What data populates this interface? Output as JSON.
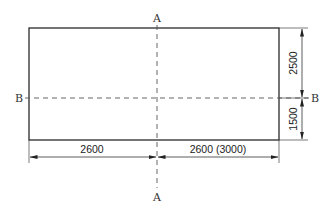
{
  "diagram": {
    "type": "plan-dimension-drawing",
    "section_labels": {
      "vertical_top": "A",
      "vertical_bottom": "A",
      "horizontal_left": "B",
      "horizontal_right": "B"
    },
    "dimensions": {
      "bottom_left": "2600",
      "bottom_right": "2600 (3000)",
      "right_top": "2500",
      "right_bottom": "1500"
    },
    "colors": {
      "outline": "#2a2a2a",
      "dashed": "#555555",
      "dimension": "#333333",
      "background": "#ffffff"
    }
  }
}
